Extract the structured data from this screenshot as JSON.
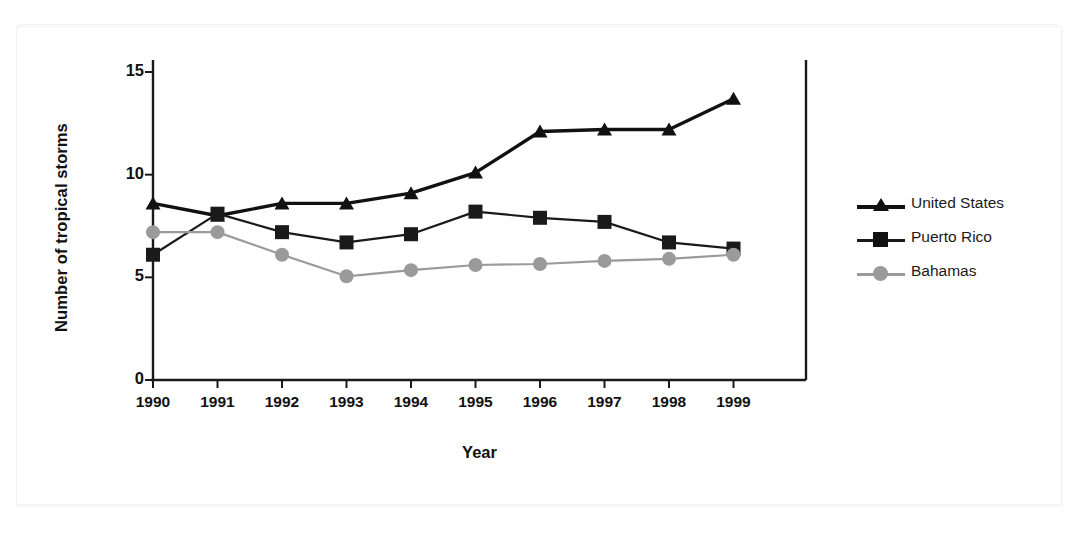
{
  "chart_data": {
    "type": "line",
    "title": "",
    "xlabel": "Year",
    "ylabel": "Number of tropical storms",
    "categories": [
      "1990",
      "1991",
      "1992",
      "1993",
      "1994",
      "1995",
      "1996",
      "1997",
      "1998",
      "1999"
    ],
    "x": [
      1990,
      1991,
      1992,
      1993,
      1994,
      1995,
      1996,
      1997,
      1998,
      1999
    ],
    "xlim": [
      1990,
      1999
    ],
    "ylim": [
      0,
      15
    ],
    "yticks": [
      "0",
      "5",
      "10",
      "15"
    ],
    "ytick_values": [
      0,
      5,
      10,
      15
    ],
    "grid": false,
    "legend_position": "right",
    "series": [
      {
        "name": "United States",
        "marker": "triangle",
        "color": "#111111",
        "values": [
          8.6,
          8.0,
          8.6,
          8.6,
          9.1,
          10.1,
          12.1,
          12.2,
          12.2,
          13.7
        ]
      },
      {
        "name": "Puerto Rico",
        "marker": "square",
        "color": "#1a1a1a",
        "values": [
          6.1,
          8.1,
          7.2,
          6.7,
          7.1,
          8.2,
          7.9,
          7.7,
          6.7,
          6.4
        ]
      },
      {
        "name": "Bahamas",
        "marker": "circle",
        "color": "#9a9a9a",
        "values": [
          7.2,
          7.2,
          6.1,
          5.05,
          5.35,
          5.6,
          5.65,
          5.8,
          5.9,
          6.1
        ]
      }
    ]
  },
  "legend": {
    "entries": [
      {
        "label": "United States"
      },
      {
        "label": "Puerto Rico"
      },
      {
        "label": "Bahamas"
      }
    ]
  }
}
